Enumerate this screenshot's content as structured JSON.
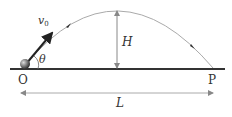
{
  "diagram": {
    "labels": {
      "origin": "O",
      "landing": "P",
      "velocity": "v",
      "velocity_sub": "0",
      "angle": "θ",
      "height": "H",
      "range": "L"
    },
    "colors": {
      "ground": "#333333",
      "trajectory": "#999999",
      "velocity_arrow": "#222222",
      "dimension": "#888888",
      "ball": "#555555"
    }
  }
}
